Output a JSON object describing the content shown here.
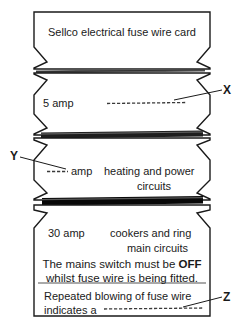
{
  "diagram": {
    "title": "Sellco electrical fuse wire card",
    "panels": [
      {
        "id": "title-panel",
        "text": "Sellco electrical fuse wire card"
      },
      {
        "id": "panel-5amp",
        "rating": "5 amp",
        "description_blank": true,
        "description": ""
      },
      {
        "id": "panel-mid-amp",
        "rating_blank": true,
        "rating_suffix": "amp",
        "description_line1": "heating and power",
        "description_line2": "circuits"
      },
      {
        "id": "panel-30amp",
        "rating": "30 amp",
        "description_line1": "cookers and ring",
        "description_line2": "main circuits",
        "warning_line1_pre": "The mains switch must be",
        "warning_line1_bold": "OFF",
        "warning_line2": "whilst fuse wire is being fitted.",
        "footer_line1": "Repeated blowing of fuse wire",
        "footer_line2_pre": "indicates a",
        "footer_line2_blank": true
      }
    ],
    "callouts": [
      {
        "label": "X",
        "points_to": "5-amp-description-blank"
      },
      {
        "label": "Y",
        "points_to": "middle-amp-rating-blank"
      },
      {
        "label": "Z",
        "points_to": "footer-cause-blank"
      }
    ],
    "fuse_wires": [
      {
        "id": "wire-5amp",
        "rating": "5 amp",
        "thickness": "thin"
      },
      {
        "id": "wire-15amp",
        "rating": "",
        "thickness": "medium"
      },
      {
        "id": "wire-30amp",
        "rating": "30 amp",
        "thickness": "thick"
      }
    ],
    "colors": {
      "ink": "#1a1a1a",
      "paper": "#ffffff",
      "wire_thin": "#4a4a4a",
      "wire_medium": "#2b2b2b",
      "wire_thick": "#111111"
    }
  }
}
